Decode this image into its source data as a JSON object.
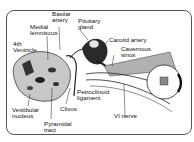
{
  "diagram": {
    "title": "",
    "labels": {
      "basilar_artery": "Basilar\nartery",
      "pituitary_gland": "Pituitary\ngland",
      "medial_lemniscus": "Medial\nlemniscus",
      "fourth_ventricle": "4th\nVentricle",
      "carotid_artery": "Carotid artery",
      "cavernous_sinus": "Cavernous\nsinus",
      "vestibular_nucleus": "Vestibular\nnucleus",
      "clivus": "Clivus",
      "petroclinoid_ligament": "Petroclinoid\nligament",
      "pyramidal_tract": "Pyramidal\ntract",
      "vi_nerve": "VI nerve"
    },
    "colors": {
      "ink": "#111111",
      "shade": "#9a9a9a",
      "frame": "#555555"
    }
  }
}
